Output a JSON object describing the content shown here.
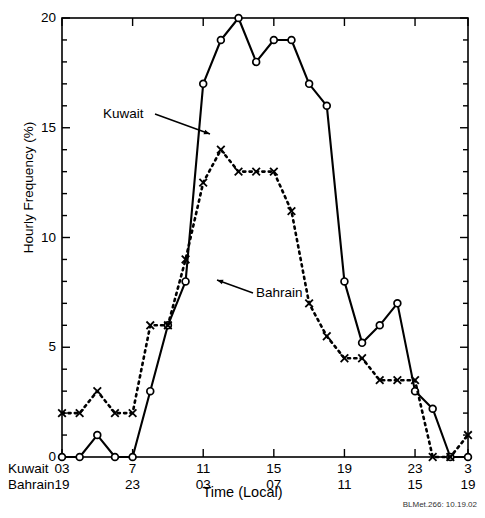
{
  "figure": {
    "header_ghost": "",
    "credit": "BLMet.266: 10.19.02",
    "xaxis_title": "Time (Local)",
    "yaxis_title": "Hourly Frequency (%)",
    "row_label_kuwait": "Kuwait",
    "row_label_bahrain": "Bahrain",
    "annotation_kuwait": "Kuwait",
    "annotation_bahrain": "Bahrain"
  },
  "chart_data": {
    "type": "line",
    "title": "",
    "xlabel": "Time (Local)",
    "ylabel": "Hourly Frequency (%)",
    "ylim": [
      0,
      20
    ],
    "yticks": [
      0,
      5,
      10,
      15,
      20
    ],
    "ytick_labels": [
      "0",
      "5",
      "10",
      "15",
      "20"
    ],
    "y_minor_tick_step": 1,
    "xlim": [
      0,
      23
    ],
    "grid": false,
    "legend": "inline-annotations",
    "x_index": [
      0,
      1,
      2,
      3,
      4,
      5,
      6,
      7,
      8,
      9,
      10,
      11,
      12,
      13,
      14,
      15,
      16,
      17,
      18,
      19,
      20,
      21,
      22,
      23
    ],
    "xticks_major_index": [
      0,
      4,
      8,
      12,
      16,
      20,
      23
    ],
    "xtick_labels_kuwait": [
      "03",
      "7",
      "11",
      "15",
      "19",
      "23",
      "3"
    ],
    "xtick_labels_bahrain": [
      "19",
      "23",
      "03",
      "07",
      "11",
      "15",
      "19"
    ],
    "series": [
      {
        "name": "Kuwait",
        "marker": "circle-open",
        "linestyle": "solid",
        "color": "#000000",
        "values": [
          0,
          0,
          1,
          0,
          0,
          3,
          6,
          8,
          17,
          19,
          20,
          18,
          19,
          19,
          17,
          16,
          8,
          5.2,
          6,
          7,
          3,
          2.2,
          0,
          0
        ]
      },
      {
        "name": "Bahrain",
        "marker": "x",
        "linestyle": "dashed",
        "color": "#000000",
        "values": [
          2,
          2,
          3,
          2,
          2,
          6,
          6,
          9,
          12.5,
          14,
          13,
          13,
          13,
          11.2,
          7,
          5.5,
          4.5,
          4.5,
          3.5,
          3.5,
          3.5,
          0,
          0,
          1
        ]
      }
    ],
    "annotations": [
      {
        "text": "Kuwait",
        "x_index": 3.0,
        "y": 15.2
      },
      {
        "text": "Bahrain",
        "x_index": 9.6,
        "y": 6.6
      }
    ]
  }
}
